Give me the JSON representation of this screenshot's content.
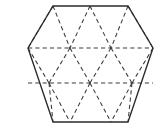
{
  "figure": {
    "type": "geometric-diagram",
    "background_color": "#ffffff",
    "canvas": {
      "width": 165,
      "height": 130
    },
    "outline": {
      "name": "hexagon-outline",
      "style": "solid",
      "color": "#2b2b2b",
      "stroke_width": 1.35,
      "vertices": [
        {
          "label": "top-left",
          "x": 53,
          "y": 6
        },
        {
          "label": "top-right",
          "x": 128,
          "y": 6
        },
        {
          "label": "right",
          "x": 153,
          "y": 48
        },
        {
          "label": "bottom-right",
          "x": 128,
          "y": 122
        },
        {
          "label": "bottom-left",
          "x": 53,
          "y": 122
        },
        {
          "label": "left",
          "x": 28,
          "y": 48
        }
      ],
      "closed": true
    },
    "interior": {
      "name": "triangular-grid",
      "style": "dashed",
      "color": "#3a3a3a",
      "stroke_width": 1.05,
      "dash_pattern": "4.2 3.1",
      "horizontal_lines": [
        {
          "label": "upper-horizontal",
          "x1": 28,
          "y1": 48,
          "x2": 153,
          "y2": 48
        },
        {
          "label": "lower-horizontal",
          "x1": 28,
          "y1": 83,
          "x2": 153,
          "y2": 83
        }
      ],
      "diagonal_lines": [
        {
          "label": "band1-d1",
          "x1": 53,
          "y1": 6,
          "x2": 28,
          "y2": 48
        },
        {
          "label": "band1-d2",
          "x1": 53,
          "y1": 6,
          "x2": 70,
          "y2": 48
        },
        {
          "label": "band1-d3",
          "x1": 90,
          "y1": 6,
          "x2": 70,
          "y2": 48
        },
        {
          "label": "band1-d4",
          "x1": 90,
          "y1": 6,
          "x2": 111,
          "y2": 48
        },
        {
          "label": "band1-d5",
          "x1": 128,
          "y1": 6,
          "x2": 111,
          "y2": 48
        },
        {
          "label": "band1-d6",
          "x1": 128,
          "y1": 6,
          "x2": 153,
          "y2": 48
        },
        {
          "label": "band2-d1",
          "x1": 28,
          "y1": 48,
          "x2": 49,
          "y2": 83
        },
        {
          "label": "band2-d2",
          "x1": 70,
          "y1": 48,
          "x2": 49,
          "y2": 83
        },
        {
          "label": "band2-d3",
          "x1": 70,
          "y1": 48,
          "x2": 90,
          "y2": 83
        },
        {
          "label": "band2-d4",
          "x1": 111,
          "y1": 48,
          "x2": 90,
          "y2": 83
        },
        {
          "label": "band2-d5",
          "x1": 111,
          "y1": 48,
          "x2": 132,
          "y2": 83
        },
        {
          "label": "band2-d6",
          "x1": 153,
          "y1": 48,
          "x2": 132,
          "y2": 83
        },
        {
          "label": "band3-d1",
          "x1": 49,
          "y1": 83,
          "x2": 53,
          "y2": 122
        },
        {
          "label": "band3-d2",
          "x1": 49,
          "y1": 83,
          "x2": 70,
          "y2": 122
        },
        {
          "label": "band3-d3",
          "x1": 90,
          "y1": 83,
          "x2": 70,
          "y2": 122
        },
        {
          "label": "band3-d4",
          "x1": 90,
          "y1": 83,
          "x2": 111,
          "y2": 122
        },
        {
          "label": "band3-d5",
          "x1": 132,
          "y1": 83,
          "x2": 111,
          "y2": 122
        },
        {
          "label": "band3-d6",
          "x1": 132,
          "y1": 83,
          "x2": 128,
          "y2": 122
        }
      ]
    }
  }
}
